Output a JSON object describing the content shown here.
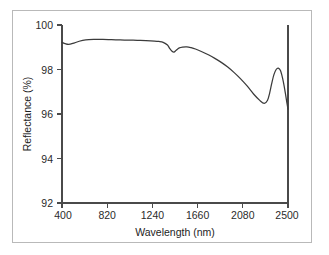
{
  "chart_data": {
    "type": "line",
    "title": "",
    "xlabel": "Wavelength (nm)",
    "ylabel": "Reflectance (%)",
    "xlim": [
      400,
      2500
    ],
    "ylim": [
      92,
      100
    ],
    "xticks": [
      400,
      820,
      1240,
      1660,
      2080,
      2500
    ],
    "xtick_labels": [
      "400",
      "820",
      "1240",
      "1660",
      "2080",
      "2500"
    ],
    "yticks": [
      92,
      94,
      96,
      98,
      100
    ],
    "ytick_labels": [
      "92",
      "94",
      "96",
      "98",
      "100"
    ],
    "grid": false,
    "legend": null,
    "series": [
      {
        "name": "Reflectance",
        "color": "#3b3b3b",
        "x": [
          400,
          430,
          460,
          500,
          560,
          620,
          700,
          780,
          860,
          940,
          1020,
          1100,
          1180,
          1260,
          1300,
          1340,
          1380,
          1400,
          1420,
          1440,
          1460,
          1490,
          1520,
          1560,
          1600,
          1640,
          1700,
          1760,
          1820,
          1880,
          1940,
          2000,
          2060,
          2120,
          2180,
          2240,
          2280,
          2310,
          2330,
          2350,
          2370,
          2390,
          2410,
          2430,
          2450,
          2470,
          2490,
          2500
        ],
        "y": [
          99.22,
          99.16,
          99.13,
          99.17,
          99.27,
          99.33,
          99.35,
          99.35,
          99.34,
          99.33,
          99.32,
          99.31,
          99.3,
          99.28,
          99.26,
          99.22,
          99.1,
          98.95,
          98.83,
          98.78,
          98.86,
          98.97,
          99.01,
          99.02,
          98.98,
          98.92,
          98.8,
          98.66,
          98.5,
          98.32,
          98.11,
          97.86,
          97.58,
          97.26,
          96.9,
          96.6,
          96.48,
          96.62,
          96.95,
          97.4,
          97.78,
          98.0,
          98.06,
          97.95,
          97.6,
          97.1,
          96.5,
          96.22
        ]
      }
    ],
    "annotations": [
      {
        "name": "right-boundary-rule",
        "type": "vline",
        "x": 2500
      }
    ]
  },
  "axis": {
    "y_title": "Reflectance (%)",
    "x_title": "Wavelength (nm)"
  }
}
